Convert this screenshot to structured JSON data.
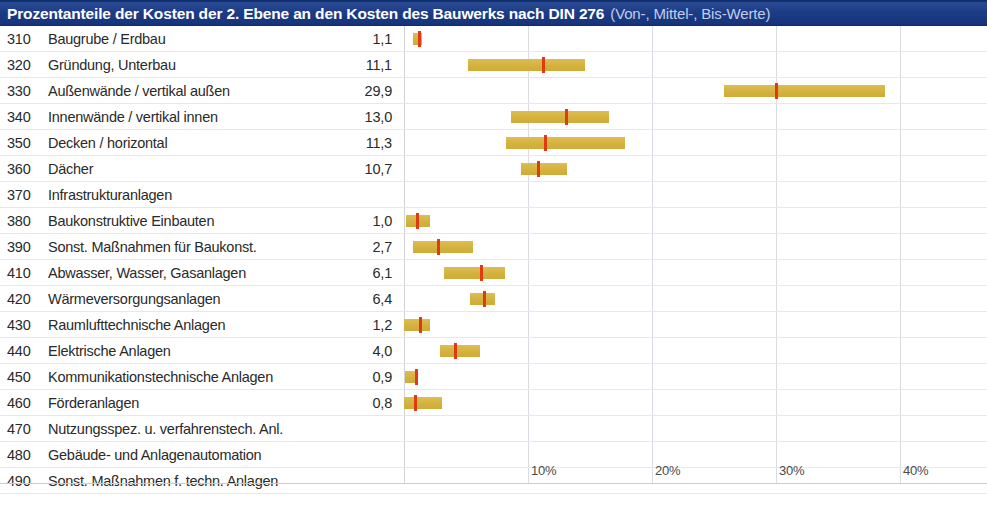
{
  "header": {
    "title_main": "Prozentanteile der Kosten der 2. Ebene an den Kosten des Bauwerks nach DIN 276",
    "title_sub": "(Von-, Mittel-, Bis-Werte)",
    "bar_color": "#1d3c86",
    "title_color": "#ffffff",
    "subtitle_color": "#c3cde6"
  },
  "colors": {
    "range_bar": "#d4b23f",
    "median_mark": "#e03a12",
    "gridline": "#d9dde3",
    "row_rule": "#e6e8eb",
    "text": "#2a2a2a"
  },
  "axis": {
    "unit": "%",
    "min": 0,
    "max": 40,
    "ticks": [
      {
        "label": "10%",
        "value": 10
      },
      {
        "label": "20%",
        "value": 20
      },
      {
        "label": "30%",
        "value": 30
      },
      {
        "label": "40%",
        "value": 40
      }
    ],
    "gridlines": [
      0,
      10,
      20,
      30,
      40
    ]
  },
  "chart_data": {
    "type": "bar",
    "title": "Prozentanteile der Kosten der 2. Ebene an den Kosten des Bauwerks nach DIN 276 (Von-, Mittel-, Bis-Werte)",
    "xlabel": "",
    "ylabel": "",
    "xlim": [
      0,
      40
    ],
    "grid": true,
    "legend": "none",
    "value_label_format": "comma-decimal",
    "categories": [
      "310 Baugrube / Erdbau",
      "320 Gründung, Unterbau",
      "330 Außenwände / vertikal außen",
      "340 Innenwände / vertikal innen",
      "350 Decken / horizontal",
      "360 Dächer",
      "370 Infrastrukturanlagen",
      "380 Baukonstruktive Einbauten",
      "390 Sonst. Maßnahmen für Baukonst.",
      "410 Abwasser, Wasser, Gasanlagen",
      "420 Wärmeversorgungsanlagen",
      "430 Raumlufttechnische Anlagen",
      "440 Elektrische Anlagen",
      "450 Kommunikationstechnische Anlagen",
      "460 Förderanlagen",
      "470 Nutzungsspez. u. verfahrenstech. Anl.",
      "480 Gebäude- und Anlagenautomation",
      "490 Sonst. Maßnahmen f. techn. Anlagen"
    ],
    "values": [
      1.1,
      11.1,
      29.9,
      13.0,
      11.3,
      10.7,
      null,
      1.0,
      2.7,
      6.1,
      6.4,
      1.2,
      4.0,
      0.9,
      0.8,
      null,
      null,
      null
    ],
    "ranges_low": [
      0.7,
      5.2,
      25.8,
      8.6,
      8.2,
      9.4,
      null,
      0.2,
      0.7,
      3.2,
      5.3,
      0.0,
      2.9,
      0.1,
      0.0,
      null,
      null,
      null
    ],
    "ranges_high": [
      1.4,
      14.6,
      38.8,
      16.5,
      17.8,
      13.1,
      null,
      2.1,
      5.5,
      8.1,
      7.3,
      2.1,
      6.1,
      1.1,
      3.1,
      null,
      null,
      null
    ]
  },
  "rows": [
    {
      "code": "310",
      "label": "Baugrube / Erdbau",
      "value": "1,1",
      "low": 0.7,
      "mid": 1.1,
      "high": 1.4
    },
    {
      "code": "320",
      "label": "Gründung, Unterbau",
      "value": "11,1",
      "low": 5.2,
      "mid": 11.1,
      "high": 14.6
    },
    {
      "code": "330",
      "label": "Außenwände / vertikal außen",
      "value": "29,9",
      "low": 25.8,
      "mid": 29.9,
      "high": 38.8
    },
    {
      "code": "340",
      "label": "Innenwände / vertikal innen",
      "value": "13,0",
      "low": 8.6,
      "mid": 13.0,
      "high": 16.5
    },
    {
      "code": "350",
      "label": "Decken / horizontal",
      "value": "11,3",
      "low": 8.2,
      "mid": 11.3,
      "high": 17.8
    },
    {
      "code": "360",
      "label": "Dächer",
      "value": "10,7",
      "low": 9.4,
      "mid": 10.7,
      "high": 13.1
    },
    {
      "code": "370",
      "label": "Infrastrukturanlagen",
      "value": "",
      "low": null,
      "mid": null,
      "high": null
    },
    {
      "code": "380",
      "label": "Baukonstruktive Einbauten",
      "value": "1,0",
      "low": 0.2,
      "mid": 1.0,
      "high": 2.1
    },
    {
      "code": "390",
      "label": "Sonst. Maßnahmen für Baukonst.",
      "value": "2,7",
      "low": 0.7,
      "mid": 2.7,
      "high": 5.5
    },
    {
      "code": "410",
      "label": "Abwasser, Wasser, Gasanlagen",
      "value": "6,1",
      "low": 3.2,
      "mid": 6.1,
      "high": 8.1
    },
    {
      "code": "420",
      "label": "Wärmeversorgungsanlagen",
      "value": "6,4",
      "low": 5.3,
      "mid": 6.4,
      "high": 7.3
    },
    {
      "code": "430",
      "label": "Raumlufttechnische Anlagen",
      "value": "1,2",
      "low": 0.0,
      "mid": 1.2,
      "high": 2.1
    },
    {
      "code": "440",
      "label": "Elektrische Anlagen",
      "value": "4,0",
      "low": 2.9,
      "mid": 4.0,
      "high": 6.1
    },
    {
      "code": "450",
      "label": "Kommunikationstechnische Anlagen",
      "value": "0,9",
      "low": 0.1,
      "mid": 0.9,
      "high": 1.1
    },
    {
      "code": "460",
      "label": "Förderanlagen",
      "value": "0,8",
      "low": 0.0,
      "mid": 0.8,
      "high": 3.1
    },
    {
      "code": "470",
      "label": "Nutzungsspez. u. verfahrenstech. Anl.",
      "value": "",
      "low": null,
      "mid": null,
      "high": null
    },
    {
      "code": "480",
      "label": "Gebäude- und Anlagenautomation",
      "value": "",
      "low": null,
      "mid": null,
      "high": null
    },
    {
      "code": "490",
      "label": "Sonst. Maßnahmen f. techn. Anlagen",
      "value": "",
      "low": null,
      "mid": null,
      "high": null
    }
  ]
}
